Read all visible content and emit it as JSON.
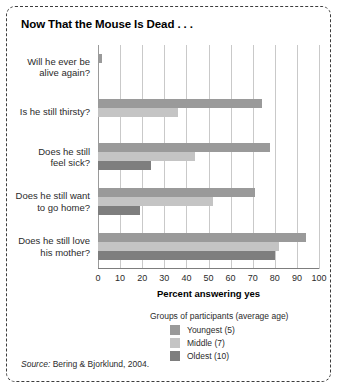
{
  "figure": {
    "title": "Now That the Mouse Is Dead . . .",
    "source_prefix": "Source:",
    "source_text": " Bering & Bjorklund, 2004."
  },
  "legend": {
    "title": "Groups of participants (average age)",
    "entries": [
      {
        "label": "Youngest (5)",
        "color": "#9a9a9a"
      },
      {
        "label": "Middle (7)",
        "color": "#c4c4c4"
      },
      {
        "label": "Oldest (10)",
        "color": "#7e7e7e"
      }
    ]
  },
  "chart_data": {
    "type": "bar",
    "orientation": "horizontal",
    "title": "Now That the Mouse Is Dead . . .",
    "xlabel": "Percent answering yes",
    "ylabel": "",
    "xlim": [
      0,
      100
    ],
    "xticks": [
      0,
      10,
      20,
      30,
      40,
      50,
      60,
      70,
      80,
      90,
      100
    ],
    "xtick_labels": [
      "0",
      "10",
      "20",
      "30",
      "40",
      "50",
      "60",
      "70",
      "80",
      "90",
      "100"
    ],
    "grid": "vertical",
    "legend_position": "below-right",
    "categories": [
      "Will he ever be\nalive again?",
      "Is he still thirsty?",
      "Does he still\nfeel sick?",
      "Does he still want\nto go home?",
      "Does he still love\nhis mother?"
    ],
    "category_lines": [
      [
        "Will he ever be",
        "alive again?"
      ],
      [
        "Is he still thirsty?"
      ],
      [
        "Does he still",
        "feel sick?"
      ],
      [
        "Does he still want",
        "to go home?"
      ],
      [
        "Does he still love",
        "his mother?"
      ]
    ],
    "series": [
      {
        "name": "Youngest (5)",
        "color": "#9a9a9a",
        "values": [
          2,
          74,
          78,
          71,
          94
        ]
      },
      {
        "name": "Middle (7)",
        "color": "#c4c4c4",
        "values": [
          0,
          36,
          44,
          52,
          82
        ]
      },
      {
        "name": "Oldest (10)",
        "color": "#7e7e7e",
        "values": [
          0,
          0,
          24,
          19,
          80
        ]
      }
    ]
  }
}
